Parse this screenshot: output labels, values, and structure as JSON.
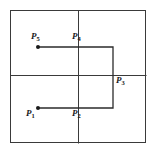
{
  "figure": {
    "kind": "geometry-diagram",
    "background_color": "#ffffff",
    "line_color": "#3a3a3a",
    "path_color": "#2b2b2b",
    "label_color": "#1a1a1a",
    "outer_box": {
      "x": 10,
      "y": 10,
      "width": 136,
      "height": 133
    },
    "grid_lines": [
      {
        "name": "vertical-divider",
        "x1": 78,
        "y1": 10,
        "x2": 78,
        "y2": 143
      },
      {
        "name": "horizontal-divider",
        "x1": 10,
        "y1": 75,
        "x2": 146,
        "y2": 75
      }
    ],
    "path": {
      "name": "staircase-path",
      "points": [
        {
          "x": 38,
          "y": 47
        },
        {
          "x": 113,
          "y": 47
        },
        {
          "x": 113,
          "y": 108
        },
        {
          "x": 38,
          "y": 108
        }
      ]
    },
    "dots": [
      {
        "name": "dot-p5",
        "x": 38,
        "y": 47
      },
      {
        "name": "dot-p1",
        "x": 38,
        "y": 108
      }
    ],
    "points": [
      {
        "id": "p5",
        "label": "P",
        "subscript": "5",
        "label_x": 31,
        "label_y": 32
      },
      {
        "id": "p4",
        "label": "P",
        "subscript": "4",
        "label_x": 72,
        "label_y": 32
      },
      {
        "id": "p3",
        "label": "P",
        "subscript": "3",
        "label_x": 116,
        "label_y": 76
      },
      {
        "id": "p2",
        "label": "P",
        "subscript": "2",
        "label_x": 72,
        "label_y": 109
      },
      {
        "id": "p1",
        "label": "P",
        "subscript": "1",
        "label_x": 26,
        "label_y": 109
      }
    ]
  }
}
